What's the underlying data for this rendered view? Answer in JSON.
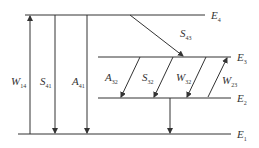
{
  "diagram": {
    "levels": [
      {
        "name": "E",
        "sub": "4"
      },
      {
        "name": "E",
        "sub": "3"
      },
      {
        "name": "E",
        "sub": "2"
      },
      {
        "name": "E",
        "sub": "1"
      }
    ],
    "transitions": [
      {
        "name": "W",
        "sub": "14"
      },
      {
        "name": "S",
        "sub": "41"
      },
      {
        "name": "A",
        "sub": "41"
      },
      {
        "name": "S",
        "sub": "43"
      },
      {
        "name": "A",
        "sub": "32"
      },
      {
        "name": "S",
        "sub": "32"
      },
      {
        "name": "W",
        "sub": "32"
      },
      {
        "name": "W",
        "sub": "23"
      }
    ]
  },
  "colors": {
    "line": "#333333",
    "background": "#ffffff"
  }
}
